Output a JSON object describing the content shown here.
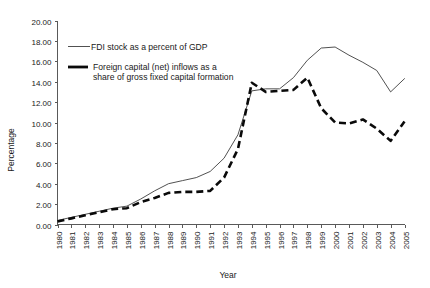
{
  "chart_data": {
    "type": "line",
    "title": "",
    "xlabel": "Year",
    "ylabel": "Percentage",
    "ylim": [
      0.0,
      20.0
    ],
    "ytick_step": 2.0,
    "ytick_labels": [
      "0.00",
      "2.00",
      "4.00",
      "6.00",
      "8.00",
      "10.00",
      "12.00",
      "14.00",
      "16.00",
      "18.00",
      "20.00"
    ],
    "grid": false,
    "legend_position": "inside-top-left",
    "categories": [
      "1980",
      "1981",
      "1982",
      "1983",
      "1984",
      "1985",
      "1986",
      "1987",
      "1988",
      "1989",
      "1990",
      "1991",
      "1992",
      "1993",
      "1994",
      "1995",
      "1996",
      "1997",
      "1998",
      "1999",
      "2000",
      "2001",
      "2002",
      "2003",
      "2004",
      "2005"
    ],
    "series": [
      {
        "name": "FDI stock as a percent of GDP",
        "style": "solid",
        "color": "#3d3d3d",
        "values": [
          0.4,
          0.7,
          1.0,
          1.3,
          1.6,
          1.8,
          2.5,
          3.3,
          4.0,
          4.3,
          4.6,
          5.2,
          6.5,
          8.8,
          13.1,
          13.3,
          13.3,
          14.4,
          16.1,
          17.3,
          17.4,
          16.6,
          15.9,
          15.1,
          13.0,
          14.3
        ]
      },
      {
        "name": "Foreign capital (net) inflows as a share of gross fixed capital formation",
        "style": "dashed",
        "color": "#0a0a0a",
        "values": [
          0.3,
          0.6,
          0.9,
          1.2,
          1.5,
          1.6,
          2.2,
          2.6,
          3.1,
          3.2,
          3.2,
          3.3,
          4.6,
          7.4,
          13.9,
          13.0,
          13.1,
          13.2,
          14.4,
          11.4,
          10.0,
          9.9,
          10.3,
          9.4,
          8.2,
          10.1
        ]
      }
    ],
    "legend": [
      {
        "label": "FDI stock as a percent of GDP",
        "style": "solid"
      },
      {
        "label": "Foreign capital (net) inflows as a",
        "label2": "share of gross fixed capital formation",
        "style": "dashed"
      }
    ]
  }
}
